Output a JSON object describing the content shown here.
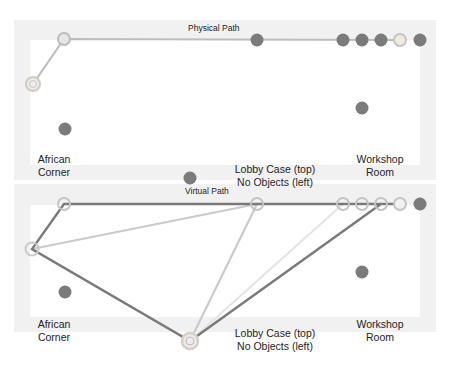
{
  "colors": {
    "background": "#ffffff",
    "panel_border": "#f0f0f0",
    "node_fill": "#7b7b7b",
    "ring_stroke": "#c4c4c4",
    "ring_fill": "#e8e8e8",
    "physical_path": "#bdbdbd",
    "virtual_path_dark": "#7a7a7a",
    "virtual_path_light": "#c8c8c8",
    "virtual_path_lighter": "#e2e2e2"
  },
  "top_panel": {
    "title": "Physical Path",
    "labels": {
      "african_corner_1": "African",
      "african_corner_2": "Corner",
      "lobby_1": "Lobby Case (top)",
      "lobby_2": "No Objects (left)",
      "workshop_1": "Workshop",
      "workshop_2": "Room"
    }
  },
  "bottom_panel": {
    "title": "Virtual Path",
    "labels": {
      "african_corner_1": "African",
      "african_corner_2": "Corner",
      "lobby_1": "Lobby Case (top)",
      "lobby_2": "No Objects (left)",
      "workshop_1": "Workshop",
      "workshop_2": "Room"
    }
  }
}
